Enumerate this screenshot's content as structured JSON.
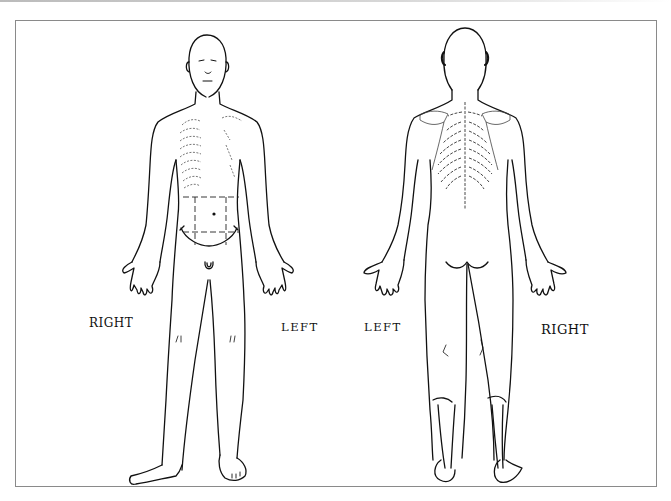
{
  "diagram": {
    "type": "body-chart",
    "views": [
      {
        "name": "anterior",
        "side_labels": {
          "left_of_image": "RIGHT",
          "right_of_image": "LEFT"
        }
      },
      {
        "name": "posterior",
        "side_labels": {
          "left_of_image": "LEFT",
          "right_of_image": "RIGHT"
        }
      }
    ]
  },
  "labels": {
    "front_right": "RIGHT",
    "front_left": "LEFT",
    "back_left": "LEFT",
    "back_right": "RIGHT"
  },
  "colors": {
    "line": "#111111",
    "frame": "#8a8a8a",
    "background": "#ffffff"
  }
}
